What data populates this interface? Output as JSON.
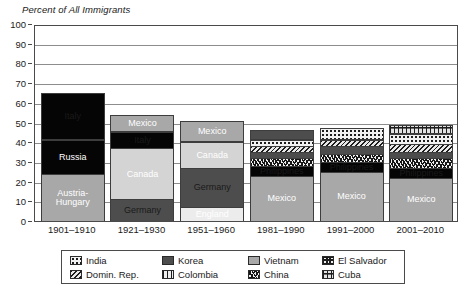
{
  "chart_data": {
    "type": "bar",
    "title": "Percent of All Immigrants",
    "xlabel": "",
    "ylabel": "Percent of All Immigrants",
    "ylim": [
      0,
      100
    ],
    "yticks": [
      0,
      10,
      20,
      30,
      40,
      50,
      60,
      70,
      80,
      90,
      100
    ],
    "grid": true,
    "legend_position": "bottom",
    "stacked": true,
    "categories": [
      "1901–1910",
      "1921–1930",
      "1951–1960",
      "1981–1990",
      "1991–2000",
      "2001–2010"
    ],
    "bar_totals": [
      65,
      54,
      51,
      46,
      47,
      49
    ],
    "bars": [
      {
        "category": "1901–1910",
        "total": 65,
        "segments": [
          {
            "name": "Austria-Hungary",
            "label": "Austria-\nHungary",
            "value": 24,
            "fill": "midgray",
            "label_color": "dark"
          },
          {
            "name": "Russia",
            "label": "Russia",
            "value": 17,
            "fill": "black",
            "label_color": "dark"
          },
          {
            "name": "Italy",
            "label": "Italy",
            "value": 24,
            "fill": "black",
            "label_color": "light"
          }
        ]
      },
      {
        "category": "1921–1930",
        "total": 54,
        "segments": [
          {
            "name": "Germany",
            "label": "Germany",
            "value": 11,
            "fill": "darkgray",
            "label_color": "light"
          },
          {
            "name": "Canada",
            "label": "Canada",
            "value": 26,
            "fill": "lightgray",
            "label_color": "dark"
          },
          {
            "name": "Italy",
            "label": "Italy",
            "value": 8,
            "fill": "black",
            "label_color": "light"
          },
          {
            "name": "Mexico",
            "label": "Mexico",
            "value": 9,
            "fill": "midgray",
            "label_color": "dark"
          }
        ]
      },
      {
        "category": "1951–1960",
        "total": 51,
        "segments": [
          {
            "name": "England",
            "label": "England",
            "value": 7,
            "fill": "verylight",
            "label_color": "dark"
          },
          {
            "name": "Germany",
            "label": "Germany",
            "value": 20,
            "fill": "darkgray",
            "label_color": "light"
          },
          {
            "name": "Canada",
            "label": "Canada",
            "value": 13,
            "fill": "lightgray",
            "label_color": "dark"
          },
          {
            "name": "Mexico",
            "label": "Mexico",
            "value": 11,
            "fill": "midgray",
            "label_color": "dark"
          }
        ]
      },
      {
        "category": "1981–1990",
        "total": 46,
        "segments": [
          {
            "name": "Mexico",
            "label": "Mexico",
            "value": 23,
            "fill": "midgray",
            "label_color": "dark"
          },
          {
            "name": "Philippines",
            "label": "Philippines",
            "value": 5,
            "fill": "black",
            "label_color": "light"
          },
          {
            "name": "China",
            "label": "",
            "value": 4,
            "fill": "china",
            "label_color": "dark"
          },
          {
            "name": "Vietnam",
            "label": "",
            "value": 3,
            "fill": "darkgray",
            "label_color": "light"
          },
          {
            "name": "Domin. Rep.",
            "label": "",
            "value": 3,
            "fill": "domrep",
            "label_color": "dark"
          },
          {
            "name": "India",
            "label": "",
            "value": 3,
            "fill": "india",
            "label_color": "dark"
          },
          {
            "name": "Korea",
            "label": "",
            "value": 5,
            "fill": "darkgray",
            "label_color": "light"
          }
        ]
      },
      {
        "category": "1991–2000",
        "total": 47,
        "segments": [
          {
            "name": "Mexico",
            "label": "Mexico",
            "value": 25,
            "fill": "midgray",
            "label_color": "dark"
          },
          {
            "name": "Philippines",
            "label": "Philippines",
            "value": 5,
            "fill": "black",
            "label_color": "light"
          },
          {
            "name": "China",
            "label": "",
            "value": 4,
            "fill": "china",
            "label_color": "dark"
          },
          {
            "name": "Vietnam",
            "label": "",
            "value": 4,
            "fill": "darkgray",
            "label_color": "light"
          },
          {
            "name": "Domin. Rep.",
            "label": "",
            "value": 3,
            "fill": "domrep",
            "label_color": "dark"
          },
          {
            "name": "India",
            "label": "",
            "value": 6,
            "fill": "india",
            "label_color": "dark"
          }
        ]
      },
      {
        "category": "2001–2010",
        "total": 49,
        "segments": [
          {
            "name": "Mexico",
            "label": "Mexico",
            "value": 22,
            "fill": "midgray",
            "label_color": "dark"
          },
          {
            "name": "Philippines",
            "label": "Philippines",
            "value": 5,
            "fill": "black",
            "label_color": "light"
          },
          {
            "name": "China",
            "label": "",
            "value": 5,
            "fill": "china",
            "label_color": "dark"
          },
          {
            "name": "Vietnam",
            "label": "",
            "value": 3,
            "fill": "darkgray",
            "label_color": "light"
          },
          {
            "name": "Domin. Rep.",
            "label": "",
            "value": 4,
            "fill": "domrep",
            "label_color": "dark"
          },
          {
            "name": "India",
            "label": "",
            "value": 5,
            "fill": "india",
            "label_color": "dark"
          },
          {
            "name": "Cuba",
            "label": "",
            "value": 5,
            "fill": "cuba",
            "label_color": "dark"
          }
        ]
      }
    ],
    "legend": [
      {
        "label": "India",
        "pattern": "india"
      },
      {
        "label": "Korea",
        "pattern": "darkgray"
      },
      {
        "label": "Vietnam",
        "pattern": "midgray"
      },
      {
        "label": "El Salvador",
        "pattern": "elsalvador"
      },
      {
        "label": "Domin. Rep.",
        "pattern": "domrep"
      },
      {
        "label": "Colombia",
        "pattern": "colombia"
      },
      {
        "label": "China",
        "pattern": "china"
      },
      {
        "label": "Cuba",
        "pattern": "cuba"
      }
    ],
    "colors": {
      "black": "#050505",
      "darkgray": "#4d4d4d",
      "midgray": "#a8a8a8",
      "lightgray": "#d4d4d4",
      "verylight": "#ececec",
      "axis": "#4a4a4a",
      "gridline": "#8d8d8d",
      "background": "#ffffff"
    }
  }
}
